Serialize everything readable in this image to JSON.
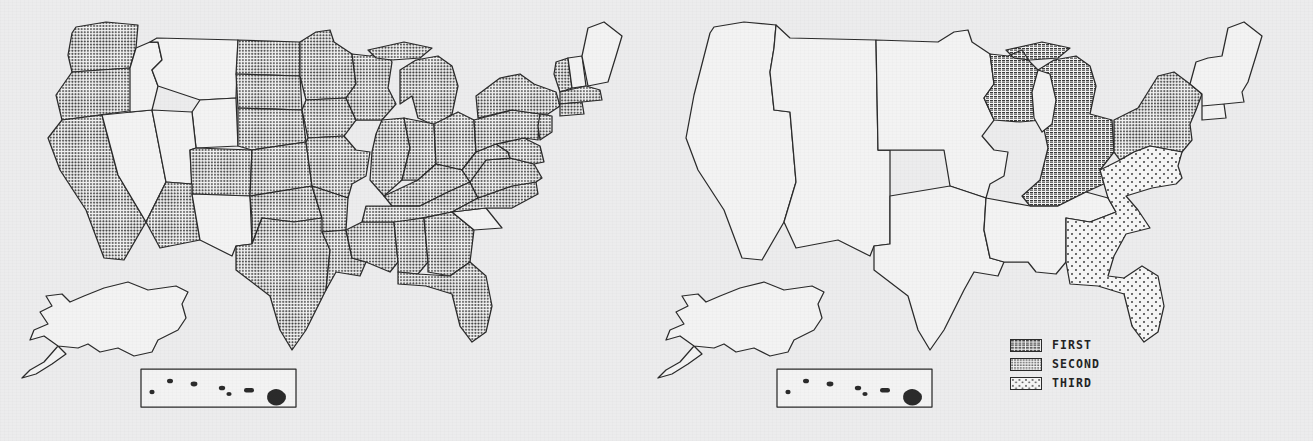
{
  "document": {
    "clipped_header_text": "",
    "background_color": "#ececed",
    "ink_color": "#2b2b2b"
  },
  "legend": {
    "name": "map-legend",
    "position": "lower-right-of-right-map",
    "items": [
      {
        "label": "FIRST",
        "pattern": "dense-crosshatch",
        "pattern_name": "first-swatch",
        "fill_hex": "#595959"
      },
      {
        "label": "SECOND",
        "pattern": "medium-dot-grid",
        "pattern_name": "second-swatch",
        "fill_hex": "#8f8f8f"
      },
      {
        "label": "THIRD",
        "pattern": "sparse-dot-grid",
        "pattern_name": "third-swatch",
        "fill_hex": "#c9c9c9"
      }
    ]
  },
  "maps": [
    {
      "id": "left-map",
      "name": "state-level-choropleth",
      "description": "United States state-level map with individual state borders; shaded states use the SECOND (medium dot) pattern.",
      "insets": [
        "alaska",
        "hawaii"
      ],
      "shading_scheme": "single-shade",
      "shaded_pattern": "second",
      "shaded_regions": [
        "Washington",
        "Oregon",
        "California",
        "Arizona",
        "Colorado",
        "North Dakota",
        "South Dakota",
        "Nebraska",
        "Kansas",
        "Oklahoma",
        "Texas",
        "Minnesota",
        "Iowa",
        "Missouri",
        "Arkansas",
        "Louisiana",
        "Wisconsin",
        "Michigan",
        "Illinois",
        "Indiana",
        "Ohio",
        "Kentucky",
        "Tennessee",
        "Mississippi",
        "Alabama",
        "Georgia",
        "Florida",
        "Pennsylvania",
        "New York",
        "New Jersey",
        "Maryland",
        "Delaware",
        "Virginia",
        "West Virginia",
        "North Carolina",
        "Vermont",
        "Massachusetts",
        "Connecticut",
        "Rhode Island"
      ],
      "unshaded_regions": [
        "Idaho",
        "Montana",
        "Wyoming",
        "Nevada",
        "Utah",
        "New Mexico",
        "South Carolina",
        "Maine",
        "New Hampshire",
        "Alaska",
        "Hawaii"
      ]
    },
    {
      "id": "right-map",
      "name": "census-division-choropleth",
      "description": "United States census-division map with three ranked shading classes.",
      "insets": [
        "alaska",
        "hawaii"
      ],
      "shading_scheme": "three-class-ranked",
      "classified_regions": [
        {
          "region": "East North Central",
          "rank": "FIRST",
          "pattern": "first"
        },
        {
          "region": "Middle Atlantic",
          "rank": "SECOND",
          "pattern": "second"
        },
        {
          "region": "South Atlantic",
          "rank": "THIRD",
          "pattern": "third"
        }
      ],
      "unshaded_regions": [
        "Pacific",
        "Mountain",
        "West North Central",
        "West South Central",
        "East South Central",
        "New England",
        "Alaska",
        "Hawaii"
      ]
    }
  ]
}
